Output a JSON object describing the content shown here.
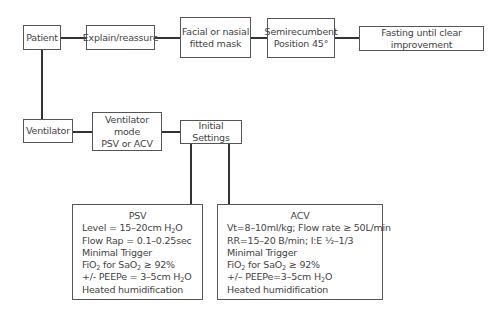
{
  "diagram": {
    "top_row": [
      {
        "id": "patient",
        "lines": [
          "Patient"
        ]
      },
      {
        "id": "explain",
        "lines": [
          "Explain/reassure"
        ]
      },
      {
        "id": "mask",
        "lines": [
          "Facial or nasial",
          "fitted mask"
        ]
      },
      {
        "id": "position",
        "lines": [
          "Semirecumbent",
          "Position 45°"
        ]
      },
      {
        "id": "fasting",
        "lines": [
          "Fasting until clear improvement"
        ]
      }
    ],
    "second_row": [
      {
        "id": "ventilator",
        "lines": [
          "Ventilator"
        ]
      },
      {
        "id": "mode",
        "lines": [
          "Ventilator mode",
          "PSV or ACV"
        ]
      },
      {
        "id": "initial",
        "lines": [
          "Initial Settings"
        ]
      }
    ],
    "psv": {
      "title": "PSV",
      "rows": [
        {
          "pre": "Level = 15–20cm H",
          "sub": "2",
          "post": "O"
        },
        {
          "pre": "Flow Rap = 0.1–0.25sec"
        },
        {
          "pre": "Minimal Trigger"
        },
        {
          "pre": "FiO",
          "sub": "2",
          "mid": " for SaO",
          "sub2": "2",
          "post": " ≥ 92%"
        },
        {
          "pre": "+/- PEEPe = 3–5cm H",
          "sub": "2",
          "post": "O"
        },
        {
          "pre": "Heated humidification"
        }
      ]
    },
    "acv": {
      "title": "ACV",
      "rows": [
        {
          "pre": "Vt=8–10ml/kg; Flow rate ≥ 50L/min"
        },
        {
          "pre": "RR=15–20 B/min; I:E ½–1/3"
        },
        {
          "pre": "Minimal Trigger"
        },
        {
          "pre": "FiO",
          "sub": "2",
          "mid": " for SaO",
          "sub2": "2",
          "post": " ≥ 92%"
        },
        {
          "pre": "+/– PEEPe=3–5cm H",
          "sub": "2",
          "post": "O"
        },
        {
          "pre": "Heated humidification"
        }
      ]
    }
  }
}
